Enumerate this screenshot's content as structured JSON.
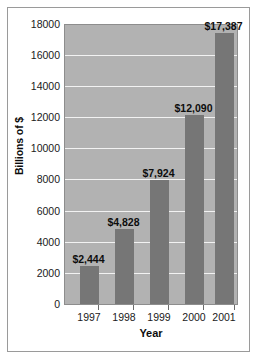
{
  "chart_data": {
    "type": "bar",
    "title": "",
    "subtitle": "",
    "xlabel": "Year",
    "ylabel": "Billions of $",
    "categories": [
      "1997",
      "1998",
      "1999",
      "2000",
      "2001"
    ],
    "values": [
      2444,
      4828,
      7924,
      12090,
      17387
    ],
    "value_labels": [
      "$2,444",
      "$4,828",
      "$7,924",
      "$12,090",
      "$17,387"
    ],
    "series": [
      {
        "name": "",
        "values": [
          2444,
          4828,
          7924,
          12090,
          17387
        ]
      }
    ],
    "ylim": [
      0,
      18000
    ],
    "ytick_values": [
      0,
      2000,
      4000,
      6000,
      8000,
      10000,
      12000,
      14000,
      16000,
      18000
    ],
    "ytick_labels": [
      "0",
      "2000",
      "4000",
      "6000",
      "8000",
      "10000",
      "12000",
      "14000",
      "16000",
      "18000"
    ],
    "grid": true,
    "grid_orientation": "horizontal",
    "legend": false,
    "legend_position": "none",
    "annotations": []
  },
  "colors": {
    "bar": "#767676",
    "plot_background": "#b2b2b2",
    "gridline": "#f2f2f2",
    "axis_text": "#1a1a1a",
    "frame_border": "#9a9a9a",
    "page_background": "#ffffff"
  }
}
